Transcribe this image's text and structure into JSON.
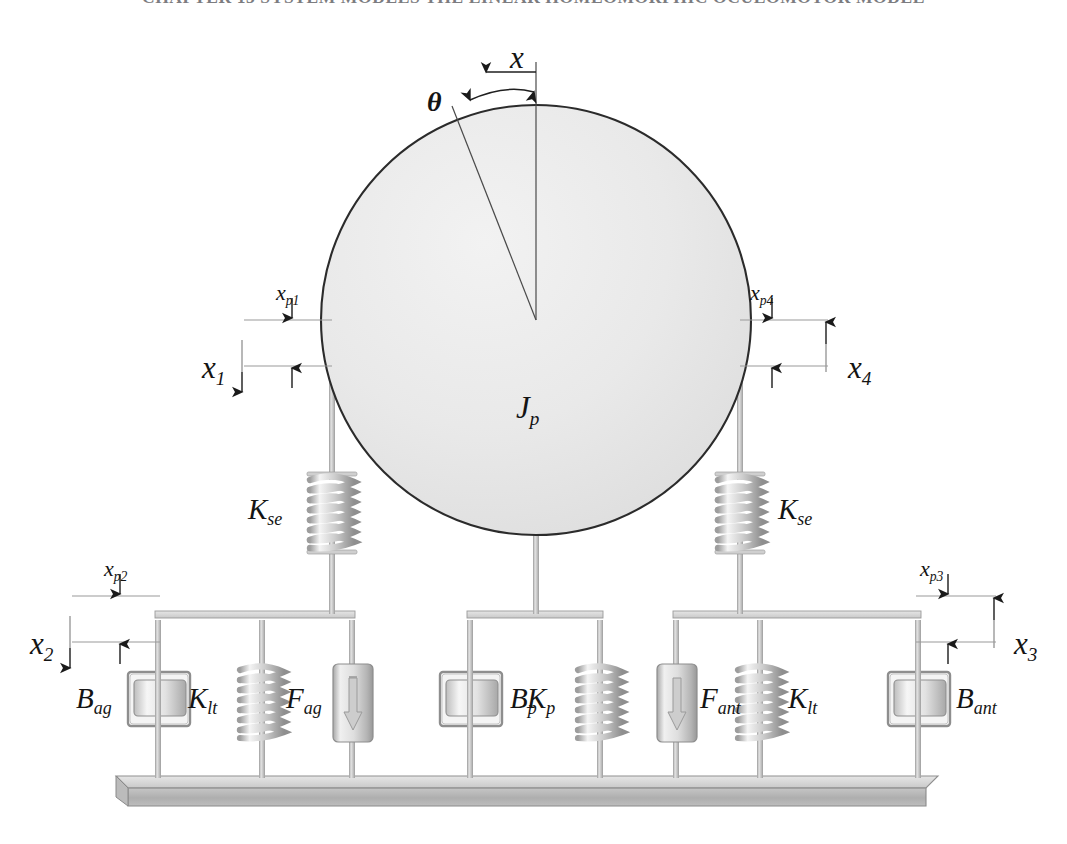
{
  "page": {
    "header_text": "CHAPTER 13  SYSTEM MODELS  THE LINEAR HOMEOMORPHIC OCULOMOTOR MODEL",
    "width": 1067,
    "height": 844,
    "background": "#ffffff"
  },
  "colors": {
    "globe_fill": "#e9e9e9",
    "globe_stroke": "#2b2b2b",
    "rod": "#b9b9b9",
    "spring": "#c9c9c9",
    "base_top": "#d6d6d6",
    "base_front": "#b0b0b0",
    "base_stroke": "#8c8c8c",
    "dim_line": "#9a9a9a",
    "label": "#141414",
    "header": "#7c7c80"
  },
  "diagram": {
    "globe": {
      "label": "J",
      "label_sub": "p",
      "cx": 536,
      "cy": 320,
      "r": 215
    },
    "angle": {
      "theta_label": "θ",
      "x_label": "x",
      "description": "rotation angle between vertical reference and tilted radius"
    },
    "springs": [
      {
        "name": "K_se_left",
        "label": "K",
        "label_sub": "se",
        "label_side": "left",
        "x": 332,
        "y_top": 476,
        "y_bottom": 552
      },
      {
        "name": "K_se_right",
        "label": "K",
        "label_sub": "se",
        "label_side": "right",
        "x": 740,
        "y_top": 476,
        "y_bottom": 552
      },
      {
        "name": "K_lt_left",
        "label": "K",
        "label_sub": "lt",
        "label_side": "left",
        "x": 262,
        "y_top": 665,
        "y_bottom": 740
      },
      {
        "name": "K_p_middle",
        "label": "K",
        "label_sub": "p",
        "label_side": "left",
        "x": 600,
        "y_top": 665,
        "y_bottom": 740
      },
      {
        "name": "K_lt_right",
        "label": "K",
        "label_sub": "lt",
        "label_side": "right",
        "x": 760,
        "y_top": 665,
        "y_bottom": 740
      }
    ],
    "dashpots": [
      {
        "name": "B_ag",
        "label": "B",
        "label_sub": "ag",
        "label_side": "left",
        "x": 158,
        "y": 700
      },
      {
        "name": "B_p",
        "label": "B",
        "label_sub": "p",
        "label_side": "right",
        "x": 470,
        "y": 700
      },
      {
        "name": "B_ant",
        "label": "B",
        "label_sub": "ant",
        "label_side": "right",
        "x": 918,
        "y": 700
      }
    ],
    "forces": [
      {
        "name": "F_ag",
        "label": "F",
        "label_sub": "ag",
        "label_side": "left",
        "x": 352,
        "y": 700,
        "arrow": "down"
      },
      {
        "name": "F_ant",
        "label": "F",
        "label_sub": "ant",
        "label_side": "right",
        "x": 676,
        "y": 700,
        "arrow": "down"
      }
    ],
    "displacements": [
      {
        "name": "x_p1",
        "label": "x",
        "label_sub": "p1",
        "arrow": "down",
        "side": "left",
        "label_x": 276,
        "label_y": 286
      },
      {
        "name": "x_1",
        "label": "x",
        "label_sub": "1",
        "arrow": "down",
        "side": "left",
        "label_x": 206,
        "label_y": 355
      },
      {
        "name": "x_p4",
        "label": "x",
        "label_sub": "p4",
        "arrow": "down",
        "side": "right",
        "label_x": 748,
        "label_y": 286
      },
      {
        "name": "x_4",
        "label": "x",
        "label_sub": "4",
        "arrow": "up",
        "side": "right",
        "label_x": 852,
        "label_y": 355
      },
      {
        "name": "x_p2",
        "label": "x",
        "label_sub": "p2",
        "arrow": "down",
        "side": "left",
        "label_x": 104,
        "label_y": 562
      },
      {
        "name": "x_2",
        "label": "x",
        "label_sub": "2",
        "arrow": "down",
        "side": "left",
        "label_x": 34,
        "label_y": 632
      },
      {
        "name": "x_p3",
        "label": "x",
        "label_sub": "p3",
        "arrow": "down",
        "side": "right",
        "label_x": 920,
        "label_y": 562
      },
      {
        "name": "x_3",
        "label": "x",
        "label_sub": "3",
        "arrow": "up",
        "side": "right",
        "label_x": 1006,
        "label_y": 632
      }
    ],
    "base": {
      "name": "ground-base",
      "x": 116,
      "y": 776,
      "width": 822,
      "height": 24
    }
  }
}
